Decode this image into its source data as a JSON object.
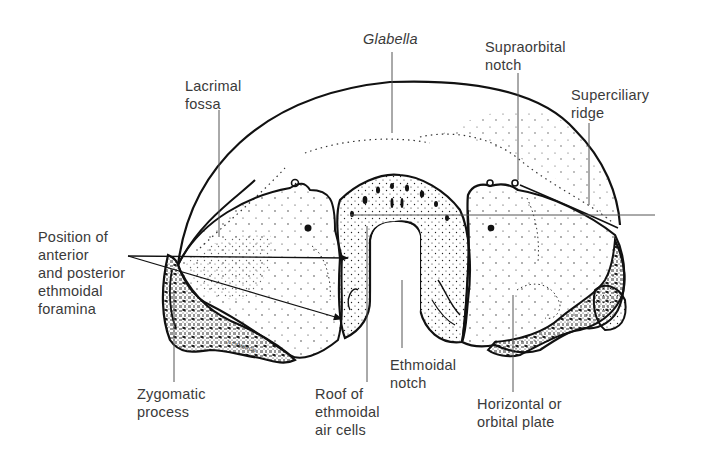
{
  "figure": {
    "signature": "J. CAMERON",
    "colors": {
      "ink": "#111111",
      "label_text": "#3a3a3a",
      "leader_line": "#555555",
      "background": "#ffffff"
    }
  },
  "labels": [
    {
      "id": "glabella",
      "text": "Glabella",
      "italic": true,
      "x": 363,
      "y": 30
    },
    {
      "id": "supraorbital-notch",
      "text": "Supraorbital\nnotch",
      "italic": false,
      "x": 485,
      "y": 38
    },
    {
      "id": "lacrimal-fossa",
      "text": "Lacrimal\nfossa",
      "italic": false,
      "x": 185,
      "y": 77
    },
    {
      "id": "superciliary-ridge",
      "text": "Superciliary\nridge",
      "italic": false,
      "x": 571,
      "y": 86
    },
    {
      "id": "ethmoidal-foramina",
      "text": "Position of\nanterior\nand posterior\nethmoidal\nforamina",
      "italic": false,
      "x": 38,
      "y": 228
    },
    {
      "id": "zygomatic-process",
      "text": "Zygomatic\nprocess",
      "italic": false,
      "x": 137,
      "y": 385
    },
    {
      "id": "roof-ethmoidal-air-cells",
      "text": "Roof of\nethmoidal\nair cells",
      "italic": false,
      "x": 315,
      "y": 385
    },
    {
      "id": "ethmoidal-notch",
      "text": "Ethmoidal\nnotch",
      "italic": false,
      "x": 390,
      "y": 356
    },
    {
      "id": "orbital-plate",
      "text": "Horizontal or\norbital plate",
      "italic": false,
      "x": 477,
      "y": 395
    }
  ]
}
